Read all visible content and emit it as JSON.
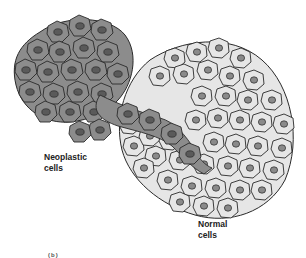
{
  "figure": {
    "type": "illustration",
    "colors": {
      "neoplastic_cell_fill": "#8c8c8c",
      "neoplastic_nucleus_fill": "#5a5a5a",
      "normal_cell_fill": "#e6e6e6",
      "normal_nucleus_fill": "#8a8a8a",
      "outline": "#2a2a2a",
      "background": "#ffffff"
    }
  },
  "labels": {
    "neoplastic": {
      "line1": "Neoplastic",
      "line2": "cells"
    },
    "normal": {
      "line1": "Normal",
      "line2": "cells"
    },
    "partial_caption": "(b)"
  }
}
